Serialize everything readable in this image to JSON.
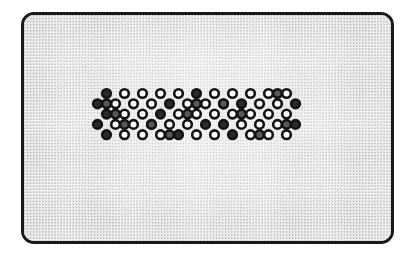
{
  "figure": {
    "title": "Binary close-packed lattice in a rounded container",
    "canvas_width": 415,
    "canvas_height": 257,
    "background_color": "#ffffff"
  },
  "container": {
    "name": "rounded-rectangle-vessel",
    "x": 21,
    "y": 12,
    "width": 373,
    "height": 232,
    "corner_radius": 13,
    "border_color": "#19191a",
    "border_width": 3,
    "fill_color": "#f3f3f3",
    "texture": "fine-gray-stipple-dots"
  },
  "legend": {
    "open_circle_label": "open site",
    "filled_circle_label": "occupied site"
  },
  "chart_data": {
    "type": "scatter",
    "title": "Binary close-packed lattice in a rounded container",
    "xlabel": "",
    "ylabel": "",
    "grid": false,
    "legend_position": "none",
    "xlim": [
      0,
      373
    ],
    "ylim": [
      0,
      232
    ],
    "marker_outline_color": "#141414",
    "marker_outline_width": 2.6,
    "marker_radius": 4.3,
    "series": [
      {
        "name": "open",
        "fill_color": "#fbfbfb",
        "points": [
          [
            100.5,
            78.5
          ],
          [
            118.5,
            78.5
          ],
          [
            136.5,
            78.5
          ],
          [
            154.5,
            78.5
          ],
          [
            190.5,
            78.5
          ],
          [
            208.5,
            78.5
          ],
          [
            226.5,
            78.5
          ],
          [
            244.5,
            78.5
          ],
          [
            262.5,
            78.5
          ],
          [
            91.5,
            88.8
          ],
          [
            109.5,
            88.8
          ],
          [
            127.5,
            88.8
          ],
          [
            163.5,
            88.8
          ],
          [
            181.5,
            88.8
          ],
          [
            199.5,
            88.8
          ],
          [
            235.5,
            88.8
          ],
          [
            253.5,
            88.8
          ],
          [
            100.5,
            99.1
          ],
          [
            118.5,
            99.1
          ],
          [
            154.5,
            99.1
          ],
          [
            172.5,
            99.1
          ],
          [
            190.5,
            99.1
          ],
          [
            208.5,
            99.1
          ],
          [
            226.5,
            99.1
          ],
          [
            244.5,
            99.1
          ],
          [
            262.5,
            99.1
          ],
          [
            91.5,
            109.4
          ],
          [
            109.5,
            109.4
          ],
          [
            127.5,
            109.4
          ],
          [
            145.5,
            109.4
          ],
          [
            163.5,
            109.4
          ],
          [
            217.5,
            109.4
          ],
          [
            235.5,
            109.4
          ],
          [
            253.5,
            109.4
          ],
          [
            100.5,
            119.7
          ],
          [
            118.5,
            119.7
          ],
          [
            136.5,
            119.7
          ],
          [
            172.5,
            119.7
          ],
          [
            190.5,
            119.7
          ],
          [
            226.5,
            119.7
          ],
          [
            244.5,
            119.7
          ],
          [
            262.5,
            119.7
          ]
        ]
      },
      {
        "name": "filled",
        "fill_color": "#2b2b2b",
        "points": [
          [
            82.5,
            78.5
          ],
          [
            172.5,
            78.5
          ],
          [
            73.5,
            88.8
          ],
          [
            145.5,
            88.8
          ],
          [
            217.5,
            88.8
          ],
          [
            271.5,
            88.8
          ],
          [
            82.5,
            99.1
          ],
          [
            136.5,
            99.1
          ],
          [
            73.5,
            109.4
          ],
          [
            181.5,
            109.4
          ],
          [
            199.5,
            109.4
          ],
          [
            271.5,
            109.4
          ],
          [
            82.5,
            119.7
          ],
          [
            154.5,
            119.7
          ],
          [
            208.5,
            119.7
          ]
        ]
      },
      {
        "name": "shaded",
        "fill_color": "#585858",
        "points": [
          [
            82.5,
            88.8
          ],
          [
            163.5,
            99.1
          ],
          [
            91.5,
            99.1
          ],
          [
            253.5,
            78.5
          ],
          [
            127.5,
            109.4
          ],
          [
            145.5,
            119.7
          ],
          [
            199.5,
            88.8
          ],
          [
            235.5,
            119.7
          ],
          [
            100.5,
            109.4
          ],
          [
            172.5,
            88.8
          ],
          [
            217.5,
            99.1
          ],
          [
            262.5,
            109.4
          ]
        ]
      }
    ],
    "row_count": 5,
    "column_count_even_rows": 12,
    "column_count_odd_rows": 12,
    "row_spacing": 10.3,
    "column_spacing": 18.0
  }
}
